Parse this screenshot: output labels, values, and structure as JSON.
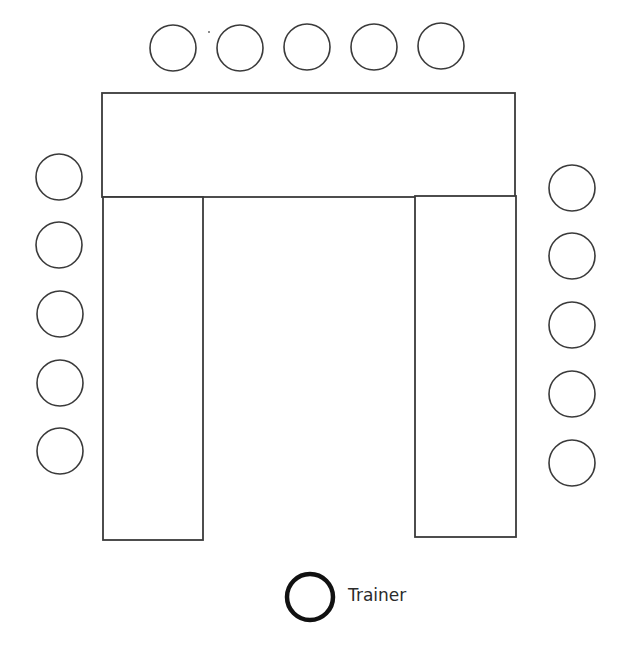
{
  "diagram": {
    "type": "u-shape-seating-layout",
    "tables": [
      {
        "name": "top-table",
        "x1": 102,
        "y1": 93,
        "x2": 515,
        "y2": 197
      },
      {
        "name": "left-table",
        "x1": 103,
        "y1": 197,
        "x2": 203,
        "y2": 540
      },
      {
        "name": "right-table",
        "x1": 415,
        "y1": 196,
        "x2": 516,
        "y2": 537
      }
    ],
    "seats": {
      "top": [
        {
          "cx": 173,
          "cy": 48
        },
        {
          "cx": 240,
          "cy": 48
        },
        {
          "cx": 307,
          "cy": 47
        },
        {
          "cx": 374,
          "cy": 47
        },
        {
          "cx": 441,
          "cy": 46
        }
      ],
      "left": [
        {
          "cx": 59,
          "cy": 177
        },
        {
          "cx": 59,
          "cy": 245
        },
        {
          "cx": 60,
          "cy": 314
        },
        {
          "cx": 60,
          "cy": 383
        },
        {
          "cx": 60,
          "cy": 451
        }
      ],
      "right": [
        {
          "cx": 572,
          "cy": 188
        },
        {
          "cx": 572,
          "cy": 256
        },
        {
          "cx": 572,
          "cy": 325
        },
        {
          "cx": 572,
          "cy": 394
        },
        {
          "cx": 572,
          "cy": 463
        }
      ]
    },
    "seat_radius": 23,
    "trainer": {
      "cx": 310,
      "cy": 597,
      "r": 23,
      "label": "Trainer"
    },
    "colors": {
      "line": "#3a3a3a",
      "trainer": "#111111",
      "text": "#2b2b2b",
      "background": "#ffffff"
    }
  }
}
